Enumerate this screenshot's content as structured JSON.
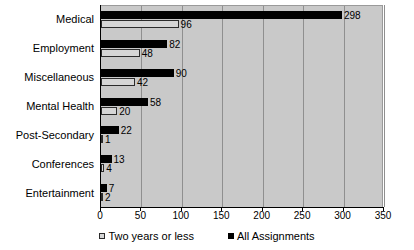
{
  "chart_data": {
    "type": "bar",
    "orientation": "horizontal",
    "title": "",
    "xlabel": "",
    "ylabel": "",
    "xlim": [
      0,
      350
    ],
    "xticks": [
      0,
      50,
      100,
      150,
      200,
      250,
      300,
      350
    ],
    "grid": true,
    "legend_position": "bottom",
    "categories": [
      "Medical",
      "Employment",
      "Miscellaneous",
      "Mental Health",
      "Post-Secondary",
      "Conferences",
      "Entertainment"
    ],
    "series": [
      {
        "name": "All Assignments",
        "color": "#000000",
        "values": [
          298,
          82,
          90,
          58,
          22,
          13,
          7
        ]
      },
      {
        "name": "Two years or less",
        "color": "#d6d6d6",
        "values": [
          96,
          48,
          42,
          20,
          1,
          4,
          2
        ]
      }
    ]
  },
  "legend": {
    "items": [
      {
        "label": "Two years or less",
        "swatch": "two"
      },
      {
        "label": "All Assignments",
        "swatch": "all"
      }
    ]
  },
  "colors": {
    "plot_background": "#c9c9c9",
    "gridline": "#8f8f8f",
    "axis": "#000000",
    "series_all": "#000000",
    "series_two": "#d6d6d6"
  }
}
